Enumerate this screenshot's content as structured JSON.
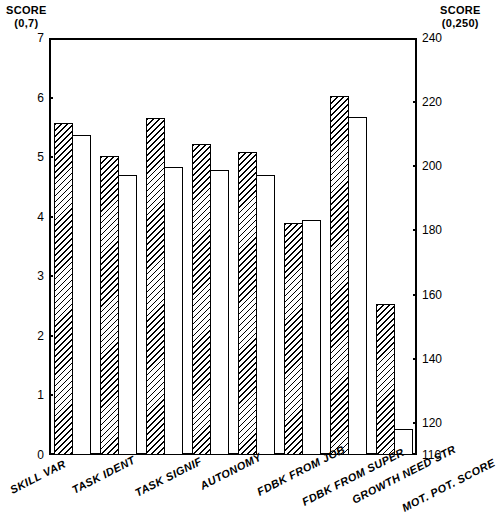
{
  "left_axis": {
    "caption": "SCORE",
    "range_label": "(0,7)",
    "ticks": [
      "0",
      "1",
      "2",
      "3",
      "4",
      "5",
      "6",
      "7"
    ]
  },
  "right_axis": {
    "caption": "SCORE",
    "range_label": "(0,250)",
    "ticks": [
      "110",
      "120",
      "140",
      "160",
      "180",
      "200",
      "220",
      "240"
    ]
  },
  "chart_data": {
    "type": "bar",
    "title": "",
    "subtitle": "",
    "xlabel": "",
    "ylabel": "SCORE (0,7)",
    "y2label": "SCORE (0,250)",
    "grid": false,
    "legend": "none",
    "ylim": [
      0,
      7
    ],
    "y2lim": [
      110,
      240
    ],
    "ytick_labels": [
      "0",
      "1",
      "2",
      "3",
      "4",
      "5",
      "6",
      "7"
    ],
    "y2tick_labels": [
      "110",
      "120",
      "140",
      "160",
      "180",
      "200",
      "220",
      "240"
    ],
    "categories": [
      "SKILL VAR",
      "TASK IDENT",
      "TASK SIGNIF",
      "AUTONOMY",
      "FDBK FROM JOB",
      "FDBK FROM SUPER",
      "GROWTH NEED STR",
      "MOT. POT. SCORE"
    ],
    "category_axis": [
      "left",
      "left",
      "left",
      "left",
      "left",
      "left",
      "left",
      "right"
    ],
    "series": [
      {
        "name": "hatched",
        "fill": "diagonal-hatch",
        "values": [
          5.57,
          5.02,
          5.65,
          5.22,
          5.08,
          3.9,
          6.02,
          2.82
        ],
        "values_right_scale": [
          null,
          null,
          null,
          null,
          null,
          null,
          null,
          157
        ]
      },
      {
        "name": "open",
        "fill": "white",
        "values": [
          5.38,
          4.7,
          4.83,
          4.78,
          4.7,
          3.95,
          5.67,
          1.12
        ],
        "values_right_scale": [
          null,
          null,
          null,
          null,
          null,
          null,
          null,
          118
        ]
      }
    ]
  }
}
